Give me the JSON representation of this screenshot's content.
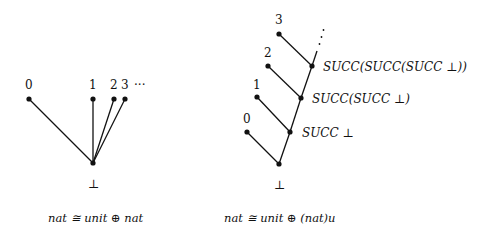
{
  "left_diagram": {
    "nodes": [
      {
        "label": "0",
        "x": 29,
        "y": 99
      },
      {
        "label": "1",
        "x": 93,
        "y": 99
      },
      {
        "label": "2",
        "x": 114,
        "y": 99
      },
      {
        "label": "3",
        "x": 125,
        "y": 99
      }
    ],
    "ellipsis": "···",
    "bottom": {
      "label": "⊥",
      "x": 93,
      "y": 163
    },
    "caption": "nat ≅ unit ⊕ nat"
  },
  "right_diagram": {
    "leaves": [
      {
        "label": "0",
        "x": 247,
        "y": 132
      },
      {
        "label": "1",
        "x": 257,
        "y": 97
      },
      {
        "label": "2",
        "x": 268,
        "y": 66
      },
      {
        "label": "3",
        "x": 279,
        "y": 34
      }
    ],
    "spine": [
      {
        "label": "⊥",
        "x": 279,
        "y": 164
      },
      {
        "label": "SUCC ⊥",
        "x": 290,
        "y": 132
      },
      {
        "label": "SUCC(SUCC ⊥)",
        "x": 301,
        "y": 98
      },
      {
        "label": "SUCC(SUCC(SUCC ⊥))",
        "x": 312,
        "y": 66
      }
    ],
    "vertical_ellipsis": "⋰",
    "caption": "nat ≅ unit ⊕ (nat)u"
  }
}
